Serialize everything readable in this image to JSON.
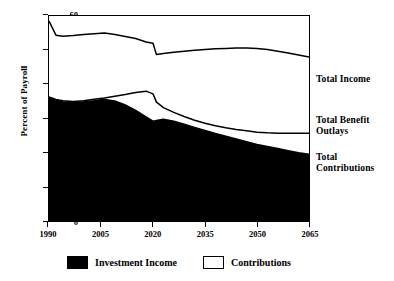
{
  "chart_data": {
    "type": "area",
    "title": "",
    "xlabel": "",
    "ylabel": "Percent of Payroll",
    "xlim": [
      1990,
      2065
    ],
    "ylim": [
      0,
      60
    ],
    "grid": false,
    "legend_position": "bottom",
    "xticks": [
      "1990",
      "2005",
      "2020",
      "2035",
      "2050",
      "2065"
    ],
    "xtick_values": [
      1990,
      2005,
      2020,
      2035,
      2050,
      2065
    ],
    "yticks": [
      "0",
      "10",
      "20",
      "30",
      "40",
      "50",
      "60"
    ],
    "ytick_values": [
      0,
      10,
      20,
      30,
      40,
      50,
      60
    ],
    "x": [
      1990,
      1992,
      1994,
      1997,
      2000,
      2003,
      2006,
      2009,
      2012,
      2015,
      2018,
      2020,
      2021,
      2023,
      2026,
      2029,
      2032,
      2035,
      2038,
      2041,
      2044,
      2047,
      2050,
      2053,
      2056,
      2059,
      2062,
      2065
    ],
    "series": [
      {
        "name": "Total Income",
        "values": [
          58.5,
          54.4,
          54.1,
          54.3,
          54.6,
          54.8,
          55.0,
          54.6,
          54.0,
          53.4,
          52.4,
          52.0,
          48.7,
          49.0,
          49.4,
          49.7,
          50.0,
          50.2,
          50.4,
          50.5,
          50.6,
          50.6,
          50.5,
          50.2,
          49.7,
          49.2,
          48.6,
          48.0
        ]
      },
      {
        "name": "Total Benefit Outlays",
        "values": [
          36.3,
          35.6,
          35.2,
          35.0,
          35.2,
          35.6,
          36.0,
          36.5,
          37.0,
          37.6,
          38.0,
          37.2,
          34.8,
          33.2,
          31.8,
          30.6,
          29.5,
          28.6,
          27.9,
          27.3,
          26.8,
          26.4,
          26.0,
          25.8,
          25.7,
          25.7,
          25.7,
          25.7
        ]
      },
      {
        "name": "Total Contributions",
        "values": [
          36.2,
          35.3,
          34.9,
          34.7,
          34.9,
          35.2,
          35.6,
          35.1,
          34.0,
          32.4,
          30.5,
          29.2,
          29.4,
          29.8,
          29.2,
          28.3,
          27.4,
          26.5,
          25.6,
          24.8,
          24.0,
          23.2,
          22.4,
          21.8,
          21.2,
          20.6,
          20.0,
          19.5
        ]
      }
    ],
    "fills": [
      {
        "name": "Investment Income",
        "color": "#000000",
        "region": "below Total Contributions"
      },
      {
        "name": "Contributions",
        "color": "#ffffff",
        "region": "between Total Contributions and Total Benefit Outlays"
      }
    ],
    "annotations": [
      {
        "text": "Total Income",
        "series": "Total Income"
      },
      {
        "text": "Total Benefit Outlays",
        "series": "Total Benefit Outlays"
      },
      {
        "text": "Total Contributions",
        "series": "Total Contributions"
      }
    ],
    "legend": [
      {
        "label": "Investment Income",
        "swatch": "filled",
        "color": "#000000"
      },
      {
        "label": "Contributions",
        "swatch": "hollow",
        "color": "#ffffff"
      }
    ]
  },
  "annotations": {
    "total_income": "Total Income",
    "total_benefit_outlays_line1": "Total Benefit",
    "total_benefit_outlays_line2": "Outlays",
    "total_contributions_line1": "Total",
    "total_contributions_line2": "Contributions"
  },
  "legend": {
    "investment_income": "Investment Income",
    "contributions": "Contributions"
  },
  "axes": {
    "y_title": "Percent of Payroll",
    "yticks": [
      "60",
      "50",
      "40",
      "30",
      "20",
      "10",
      "0"
    ],
    "xticks": [
      "1990",
      "2005",
      "2020",
      "2035",
      "2050",
      "2065"
    ]
  }
}
